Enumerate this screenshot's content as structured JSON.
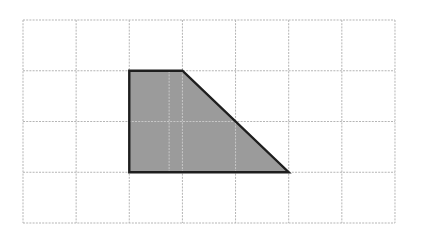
{
  "diagram": {
    "type": "grid-with-shape",
    "grid": {
      "columns": 7,
      "rows": 4,
      "origin_px": [
        23,
        20
      ],
      "cell_width_px": 53.14,
      "cell_height_px": 50.75,
      "line_color": "#b5b5b5",
      "line_style": "dashed"
    },
    "shape": {
      "name": "trapezoid",
      "vertices_grid": [
        [
          2,
          1
        ],
        [
          3,
          1
        ],
        [
          5,
          3
        ],
        [
          2,
          3
        ]
      ],
      "fill_color": "#9b9b9b",
      "stroke_color": "#1e1e1e",
      "inner_grid_line_color": "#c8c8c8"
    },
    "background_color": "#ffffff"
  }
}
